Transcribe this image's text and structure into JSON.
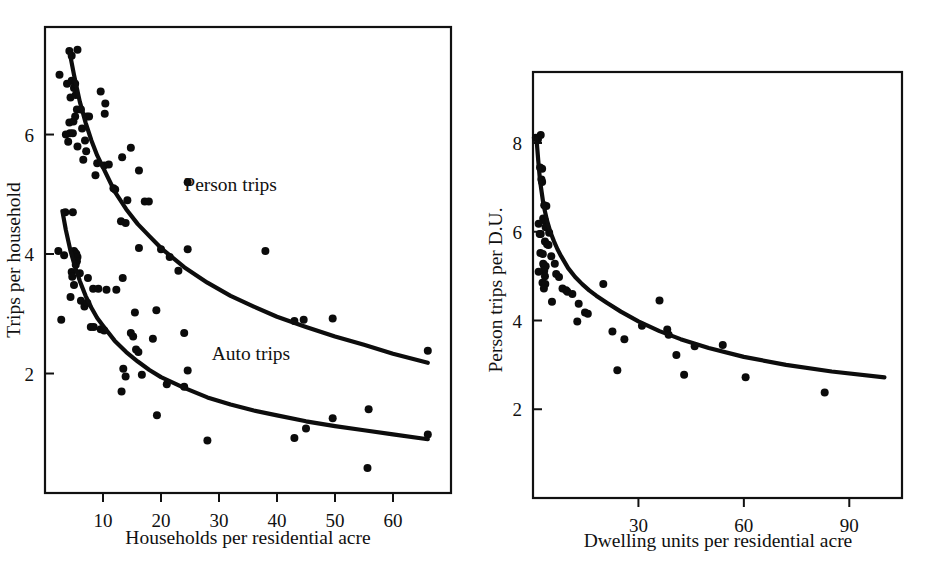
{
  "figure": {
    "background": "#ffffff",
    "ink_color": "#111111",
    "width": 936,
    "height": 581,
    "panel_count": 2
  },
  "chart_data": [
    {
      "id": "left-panel",
      "type": "scatter",
      "title": "",
      "xlabel": "Households per residential acre",
      "ylabel": "Trips per household",
      "xlim": [
        0,
        70
      ],
      "ylim": [
        0,
        7.8
      ],
      "xticks": [
        10,
        20,
        30,
        40,
        50,
        60
      ],
      "yticks": [
        2,
        4,
        6
      ],
      "xticklabels": [
        "10",
        "20",
        "30",
        "40",
        "50",
        "60"
      ],
      "yticklabels": [
        "2",
        "4",
        "6"
      ],
      "grid": false,
      "legend_position": "inline-annotation",
      "annotations": [
        {
          "text": "Person trips",
          "x": 32.0,
          "y": 5.05
        },
        {
          "text": "Auto trips",
          "x": 35.5,
          "y": 2.22
        }
      ],
      "series": [
        {
          "name": "Person trips",
          "marker": "filled-circle",
          "fit_curve": {
            "form": "power-law",
            "points_x": [
              4.3,
              5,
              6,
              7,
              8,
              9,
              10,
              12,
              14,
              16,
              18,
              20,
              24,
              28,
              32,
              36,
              40,
              45,
              50,
              55,
              60,
              66
            ],
            "points_y": [
              7.35,
              7.0,
              6.55,
              6.2,
              5.9,
              5.65,
              5.45,
              5.05,
              4.75,
              4.5,
              4.3,
              4.1,
              3.78,
              3.52,
              3.3,
              3.12,
              2.95,
              2.78,
              2.62,
              2.48,
              2.33,
              2.18
            ]
          },
          "points": [
            [
              2.5,
              7.0
            ],
            [
              4.2,
              7.4
            ],
            [
              4.6,
              7.32
            ],
            [
              5.6,
              7.42
            ],
            [
              3.8,
              6.85
            ],
            [
              4.6,
              6.9
            ],
            [
              5.0,
              6.78
            ],
            [
              5.2,
              6.85
            ],
            [
              4.4,
              6.62
            ],
            [
              5.3,
              6.66
            ],
            [
              9.6,
              6.72
            ],
            [
              5.5,
              6.42
            ],
            [
              6.2,
              6.42
            ],
            [
              10.4,
              6.52
            ],
            [
              4.2,
              6.2
            ],
            [
              4.9,
              6.22
            ],
            [
              5.2,
              6.3
            ],
            [
              7.2,
              6.3
            ],
            [
              7.6,
              6.3
            ],
            [
              10.3,
              6.35
            ],
            [
              3.6,
              6.0
            ],
            [
              4.3,
              6.02
            ],
            [
              4.8,
              6.02
            ],
            [
              6.4,
              6.1
            ],
            [
              6.9,
              5.9
            ],
            [
              4.0,
              5.88
            ],
            [
              5.6,
              5.8
            ],
            [
              7.1,
              5.72
            ],
            [
              14.8,
              5.78
            ],
            [
              6.6,
              5.58
            ],
            [
              13.3,
              5.62
            ],
            [
              9.0,
              5.52
            ],
            [
              10.2,
              5.48
            ],
            [
              11.0,
              5.5
            ],
            [
              16.2,
              5.4
            ],
            [
              8.7,
              5.32
            ],
            [
              11.8,
              5.1
            ],
            [
              12.1,
              5.08
            ],
            [
              24.6,
              5.2
            ],
            [
              14.2,
              4.9
            ],
            [
              17.2,
              4.88
            ],
            [
              17.9,
              4.88
            ],
            [
              13.1,
              4.55
            ],
            [
              13.9,
              4.52
            ],
            [
              16.2,
              4.1
            ],
            [
              20.0,
              4.08
            ],
            [
              24.6,
              4.08
            ],
            [
              38.0,
              4.05
            ],
            [
              21.5,
              3.95
            ],
            [
              23.0,
              3.72
            ],
            [
              43.0,
              2.88
            ],
            [
              44.6,
              2.9
            ],
            [
              49.6,
              2.92
            ],
            [
              66.0,
              2.38
            ]
          ]
        },
        {
          "name": "Auto trips",
          "marker": "filled-circle",
          "fit_curve": {
            "form": "power-law",
            "points_x": [
              3.0,
              3.6,
              4.4,
              5.2,
              6,
              7,
              8,
              9,
              10,
              12,
              14,
              16,
              18,
              20,
              24,
              28,
              32,
              36,
              40,
              45,
              50,
              55,
              60,
              66
            ],
            "points_y": [
              4.72,
              4.4,
              4.05,
              3.78,
              3.55,
              3.3,
              3.1,
              2.93,
              2.8,
              2.55,
              2.36,
              2.2,
              2.06,
              1.94,
              1.76,
              1.6,
              1.48,
              1.38,
              1.3,
              1.2,
              1.12,
              1.05,
              0.98,
              0.9
            ]
          },
          "points": [
            [
              3.5,
              4.7
            ],
            [
              4.8,
              4.7
            ],
            [
              2.3,
              4.05
            ],
            [
              3.3,
              3.98
            ],
            [
              5.0,
              4.05
            ],
            [
              5.2,
              4.02
            ],
            [
              5.4,
              4.0
            ],
            [
              5.6,
              3.95
            ],
            [
              5.5,
              3.88
            ],
            [
              5.3,
              3.82
            ],
            [
              4.6,
              3.7
            ],
            [
              4.7,
              3.62
            ],
            [
              6.0,
              3.68
            ],
            [
              7.4,
              3.6
            ],
            [
              13.4,
              3.6
            ],
            [
              5.0,
              3.48
            ],
            [
              8.3,
              3.42
            ],
            [
              9.2,
              3.42
            ],
            [
              10.6,
              3.4
            ],
            [
              12.3,
              3.4
            ],
            [
              4.4,
              3.28
            ],
            [
              6.2,
              3.22
            ],
            [
              6.8,
              3.12
            ],
            [
              7.3,
              3.18
            ],
            [
              2.8,
              2.9
            ],
            [
              15.5,
              3.02
            ],
            [
              19.2,
              3.06
            ],
            [
              7.9,
              2.78
            ],
            [
              8.4,
              2.78
            ],
            [
              9.6,
              2.74
            ],
            [
              10.2,
              2.72
            ],
            [
              14.8,
              2.68
            ],
            [
              15.2,
              2.62
            ],
            [
              18.6,
              2.58
            ],
            [
              24.0,
              2.68
            ],
            [
              15.7,
              2.4
            ],
            [
              16.1,
              2.36
            ],
            [
              13.5,
              2.08
            ],
            [
              13.9,
              1.95
            ],
            [
              16.7,
              1.98
            ],
            [
              24.6,
              2.05
            ],
            [
              21.0,
              1.82
            ],
            [
              24.0,
              1.78
            ],
            [
              13.2,
              1.7
            ],
            [
              19.3,
              1.3
            ],
            [
              28.0,
              0.88
            ],
            [
              43.0,
              0.92
            ],
            [
              45.0,
              1.08
            ],
            [
              49.6,
              1.25
            ],
            [
              55.8,
              1.4
            ],
            [
              66.0,
              0.98
            ],
            [
              55.6,
              0.42
            ]
          ]
        }
      ]
    },
    {
      "id": "right-panel",
      "type": "scatter",
      "title": "",
      "xlabel": "Dwelling units per residential acre",
      "ylabel": "Person trips per D.U.",
      "xlim": [
        0,
        105
      ],
      "ylim": [
        0,
        9.6
      ],
      "xticks": [
        30,
        60,
        90
      ],
      "yticks": [
        2,
        4,
        6,
        8
      ],
      "xticklabels": [
        "30",
        "60",
        "90"
      ],
      "yticklabels": [
        "2",
        "4",
        "6",
        "8"
      ],
      "grid": false,
      "legend_position": "none",
      "annotations": [],
      "series": [
        {
          "name": "Person trips per D.U.",
          "marker": "filled-circle",
          "fit_curve": {
            "form": "power-law",
            "points_x": [
              1.0,
              1.5,
              2,
              3,
              4,
              5,
              6,
              7,
              8,
              10,
              12,
              14,
              16,
              18,
              21,
              25,
              30,
              36,
              42,
              50,
              60,
              72,
              85,
              100
            ],
            "points_y": [
              8.1,
              7.6,
              7.15,
              6.6,
              6.25,
              5.98,
              5.78,
              5.6,
              5.45,
              5.18,
              4.98,
              4.82,
              4.68,
              4.56,
              4.4,
              4.2,
              3.98,
              3.76,
              3.58,
              3.38,
              3.18,
              3.0,
              2.85,
              2.72
            ]
          },
          "points": [
            [
              0.8,
              8.12
            ],
            [
              1.4,
              8.08
            ],
            [
              2.2,
              8.18
            ],
            [
              2.0,
              7.45
            ],
            [
              2.6,
              7.42
            ],
            [
              2.4,
              7.18
            ],
            [
              2.6,
              7.12
            ],
            [
              3.2,
              6.6
            ],
            [
              3.8,
              6.58
            ],
            [
              2.9,
              6.3
            ],
            [
              3.4,
              6.25
            ],
            [
              1.6,
              6.18
            ],
            [
              3.6,
              6.1
            ],
            [
              1.9,
              5.95
            ],
            [
              2.2,
              5.95
            ],
            [
              4.6,
              5.98
            ],
            [
              3.4,
              5.78
            ],
            [
              4.0,
              5.72
            ],
            [
              4.4,
              5.7
            ],
            [
              2.1,
              5.52
            ],
            [
              2.8,
              5.5
            ],
            [
              5.2,
              5.45
            ],
            [
              2.9,
              5.28
            ],
            [
              3.1,
              5.25
            ],
            [
              3.3,
              5.2
            ],
            [
              3.6,
              5.22
            ],
            [
              3.2,
              5.12
            ],
            [
              1.6,
              5.1
            ],
            [
              3.4,
              5.0
            ],
            [
              2.7,
              4.85
            ],
            [
              3.5,
              4.82
            ],
            [
              3.1,
              4.72
            ],
            [
              6.2,
              5.28
            ],
            [
              6.6,
              5.05
            ],
            [
              7.4,
              4.98
            ],
            [
              5.4,
              4.42
            ],
            [
              8.4,
              4.72
            ],
            [
              9.4,
              4.68
            ],
            [
              9.8,
              4.65
            ],
            [
              11.2,
              4.6
            ],
            [
              13.0,
              4.38
            ],
            [
              14.8,
              4.18
            ],
            [
              15.6,
              4.15
            ],
            [
              12.6,
              3.98
            ],
            [
              20.0,
              4.82
            ],
            [
              22.6,
              3.75
            ],
            [
              26.0,
              3.58
            ],
            [
              24.0,
              2.88
            ],
            [
              31.0,
              3.88
            ],
            [
              36.0,
              4.45
            ],
            [
              38.2,
              3.8
            ],
            [
              38.6,
              3.68
            ],
            [
              40.8,
              3.22
            ],
            [
              43.0,
              2.78
            ],
            [
              46.0,
              3.42
            ],
            [
              54.0,
              3.45
            ],
            [
              60.5,
              2.72
            ],
            [
              83.0,
              2.38
            ]
          ]
        }
      ]
    }
  ]
}
